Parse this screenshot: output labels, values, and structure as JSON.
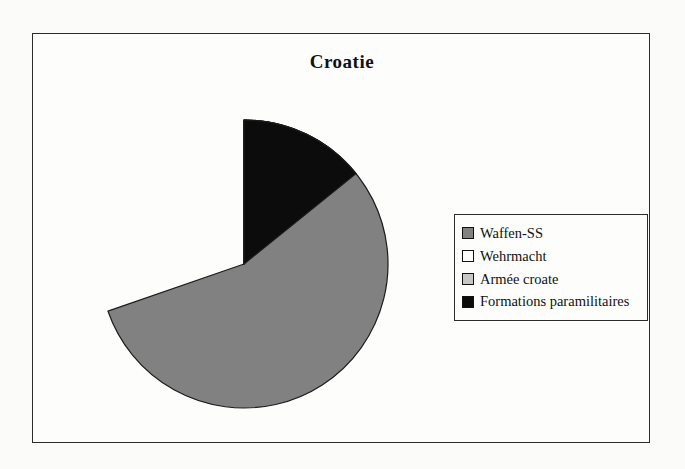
{
  "page": {
    "background": "#fbfbfa"
  },
  "chart_data": {
    "type": "pie",
    "title": "Croatie",
    "categories": [
      "Waffen-SS",
      "Wehrmacht",
      "Armée croate",
      "Formations paramilitaires"
    ],
    "values": [
      69.7,
      4.4,
      11.7,
      14.2
    ],
    "unit": "percent",
    "colors": [
      "#818181",
      "#fdfdfd",
      "#c6c6c6",
      "#0c0c0c"
    ],
    "outline_color": "#1c1c1c",
    "start_angle_deg": 0,
    "direction": "clockwise",
    "legend_position": "right",
    "grid": "off"
  }
}
